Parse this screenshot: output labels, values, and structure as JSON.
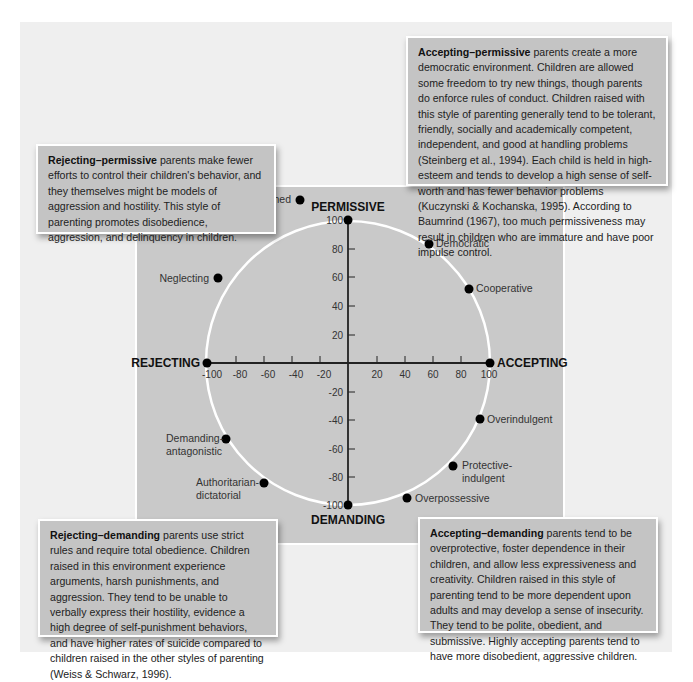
{
  "callouts": {
    "accepting_permissive": {
      "title": "Accepting–permissive",
      "text": " parents create a more democratic environment. Children are allowed some freedom to try new things, though parents do enforce rules of conduct. Children raised with this style of parenting generally tend to be tolerant, friendly, socially and academically competent, independent, and good at handling problems (Steinberg et al., 1994). Each child is held in high-esteem and tends to develop a high sense of self-worth and has fewer behavior problems (Kuczynski & Kochanska, 1995). According to Baumrind (1967), too much permissiveness may result in children who are immature and have poor impulse control."
    },
    "rejecting_permissive": {
      "title": "Rejecting–permissive",
      "text": " parents make fewer efforts to control their children's behavior, and they themselves might be models of aggression and hostility. This style of parenting promotes disobedience, aggression, and delinquency in children."
    },
    "rejecting_demanding": {
      "title": "Rejecting–demanding",
      "text": " parents use strict rules and require total obedience. Children raised in this environment experience arguments, harsh punishments, and aggression. They tend to be unable to verbally express their hostility, evidence a high degree of self-punishment behaviors, and have higher rates of suicide compared to children raised in the other styles of parenting (Weiss & Schwarz, 1996)."
    },
    "accepting_demanding": {
      "title": "Accepting–demanding",
      "text": " parents tend to be overprotective, foster dependence in their children, and allow less expressiveness and creativity. Children raised in this style of parenting tend to be more dependent upon adults and may develop a sense of insecurity. They tend to be polite, obedient, and submissive. Highly accepting parents tend to have more disobedient, aggressive children."
    }
  },
  "axes": {
    "top": "PERMISSIVE",
    "bottom": "DEMANDING",
    "left": "REJECTING",
    "right": "ACCEPTING",
    "x_ticks": [
      "-100",
      "-80",
      "-60",
      "-40",
      "-20",
      "20",
      "40",
      "60",
      "80",
      "100"
    ],
    "y_ticks": [
      "100",
      "80",
      "60",
      "40",
      "20",
      "-20",
      "-40",
      "-60",
      "-80",
      "-100"
    ]
  },
  "colors": {
    "outer_bg": "#efefef",
    "panel_bg": "#c9c9c9",
    "callout_bg": "#c4c4c4",
    "circle": "#ffffff",
    "points": "#000000"
  },
  "points": [
    {
      "label": "Detached",
      "x": -34,
      "y": 94
    },
    {
      "label": "Indifferent",
      "x": -66,
      "y": 75
    },
    {
      "label": "Neglecting",
      "x": -92,
      "y": 39
    },
    {
      "label": "Democratic",
      "x": 57,
      "y": 82
    },
    {
      "label": "Cooperative",
      "x": 85,
      "y": 51
    },
    {
      "label": "Overindulgent",
      "x": 93,
      "y": -39
    },
    {
      "label": "Protective-indulgent",
      "x": 74,
      "y": -72
    },
    {
      "label": "Overpossessive",
      "x": 42,
      "y": -93
    },
    {
      "label": "Demanding-antagonistic",
      "x": -86,
      "y": -53
    },
    {
      "label": "Authoritarian-dictatorial",
      "x": -59,
      "y": -84
    }
  ],
  "labels": {
    "detached": "Detached",
    "indifferent": "Indifferent",
    "neglecting": "Neglecting",
    "democratic": "Democratic",
    "cooperative": "Cooperative",
    "overindulgent": "Overindulgent",
    "protective_1": "Protective-",
    "protective_2": "indulgent",
    "overpossessive": "Overpossessive",
    "demanding_1": "Demanding-",
    "demanding_2": "antagonistic",
    "authoritarian_1": "Authoritarian-",
    "authoritarian_2": "dictatorial"
  }
}
